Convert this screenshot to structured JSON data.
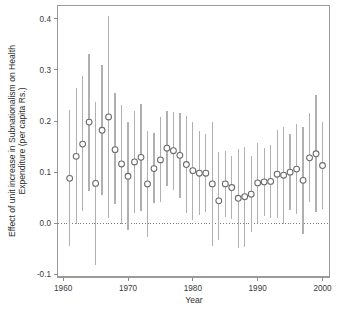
{
  "chart_data": {
    "type": "scatter",
    "title": "",
    "subtitle": "",
    "xlabel": "Year",
    "ylabel": "Effect of unit increase in Subnationalism on Health Expenditure (per capita Rs.)",
    "ylabel_line1": "Effect of unit increase in Subnationalism on Health",
    "ylabel_line2": "Expenditure (per capita Rs.)",
    "xlim": [
      1959.2,
      2001.0
    ],
    "ylim": [
      -0.105,
      0.425
    ],
    "xticks": [
      1960,
      1970,
      1980,
      1990,
      2000
    ],
    "xticklabels": [
      "1960",
      "1970",
      "1980",
      "1990",
      "2000"
    ],
    "yticks": [
      -0.1,
      0.0,
      0.1,
      0.2,
      0.3,
      0.4
    ],
    "yticklabels": [
      "-0.1",
      "0.0",
      "0.1",
      "0.2",
      "0.3",
      "0.4"
    ],
    "grid": false,
    "legend": null,
    "legend_position": "none",
    "reference_line": {
      "y": 0.0,
      "style": "dotted",
      "color": "#6e6e6e"
    },
    "marker": {
      "shape": "open-circle",
      "color": "#6b6b6b",
      "fill": "#ffffff",
      "size": 4
    },
    "errorbar": {
      "style": "vertical-line",
      "color": "#b0b0b0",
      "label": "confidence interval"
    },
    "series": [
      {
        "name": "Estimated effect with confidence interval",
        "x": [
          1961,
          1962,
          1963,
          1964,
          1965,
          1966,
          1967,
          1968,
          1969,
          1970,
          1971,
          1972,
          1973,
          1974,
          1975,
          1976,
          1977,
          1978,
          1979,
          1980,
          1981,
          1982,
          1983,
          1984,
          1985,
          1986,
          1987,
          1988,
          1989,
          1990,
          1991,
          1992,
          1993,
          1994,
          1995,
          1996,
          1997,
          1998,
          1999,
          2000
        ],
        "values": [
          0.088,
          0.131,
          0.155,
          0.198,
          0.078,
          0.182,
          0.208,
          0.144,
          0.116,
          0.092,
          0.12,
          0.129,
          0.077,
          0.107,
          0.124,
          0.147,
          0.142,
          0.133,
          0.115,
          0.103,
          0.098,
          0.098,
          0.077,
          0.044,
          0.077,
          0.07,
          0.049,
          0.052,
          0.057,
          0.079,
          0.081,
          0.082,
          0.096,
          0.094,
          0.1,
          0.106,
          0.084,
          0.128,
          0.136,
          0.113
        ],
        "ci_lower": [
          -0.045,
          -0.002,
          0.024,
          0.064,
          -0.081,
          0.056,
          0.01,
          0.037,
          -0.001,
          -0.014,
          0.021,
          0.024,
          -0.027,
          0.039,
          0.042,
          0.073,
          0.066,
          0.049,
          0.021,
          0.007,
          0.016,
          0.022,
          -0.045,
          -0.032,
          0.013,
          0.008,
          -0.048,
          -0.046,
          -0.017,
          0.001,
          0.014,
          0.011,
          0.01,
          -0.001,
          0.026,
          0.018,
          -0.021,
          0.041,
          0.022,
          0.028
        ],
        "ci_upper": [
          0.221,
          0.265,
          0.289,
          0.332,
          0.237,
          0.309,
          0.406,
          0.255,
          0.232,
          0.198,
          0.219,
          0.234,
          0.181,
          0.176,
          0.207,
          0.22,
          0.218,
          0.216,
          0.209,
          0.198,
          0.18,
          0.174,
          0.198,
          0.14,
          0.141,
          0.131,
          0.145,
          0.149,
          0.131,
          0.157,
          0.148,
          0.154,
          0.182,
          0.189,
          0.174,
          0.195,
          0.189,
          0.216,
          0.25,
          0.198
        ]
      }
    ]
  },
  "axes": {
    "x_axis_title": "Year",
    "y_axis_title_line1": "Effect of unit increase in Subnationalism on Health",
    "y_axis_title_line2": "Expenditure (per capita Rs.)"
  }
}
